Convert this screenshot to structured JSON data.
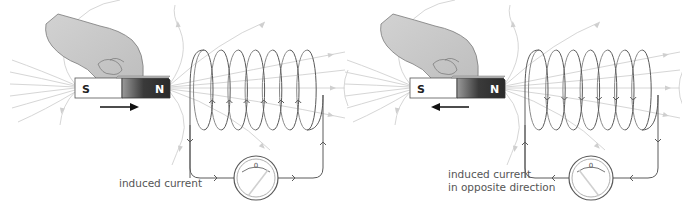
{
  "panels": [
    {
      "id": "magnet-in",
      "magnet": {
        "south_label": "S",
        "north_label": "N"
      },
      "motion_direction": "right",
      "current_direction": "up",
      "galvanometer": {
        "zero_label": "0",
        "needle": "right"
      },
      "caption_lines": [
        "induced current"
      ]
    },
    {
      "id": "magnet-out",
      "magnet": {
        "south_label": "S",
        "north_label": "N"
      },
      "motion_direction": "left",
      "current_direction": "down",
      "galvanometer": {
        "zero_label": "0",
        "needle": "left"
      },
      "caption_lines": [
        "induced current",
        "in opposite direction"
      ]
    }
  ],
  "colors": {
    "hand": "#c8c8c8",
    "magnet_south": "#ffffff",
    "magnet_north": "#3a3a3a",
    "wire": "#5a5a5a",
    "field_lines": "#d6d6d6"
  }
}
